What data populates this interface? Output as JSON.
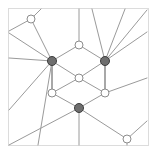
{
  "figure": {
    "title": "",
    "width": 160,
    "height": 159,
    "background_color": "#ffffff",
    "frame": {
      "visible": true,
      "style": "dotted",
      "color": "#b9b9b9",
      "x": 8.5,
      "y": 8.5,
      "width": 140,
      "height": 137
    }
  },
  "legend": {
    "filled_node_label": "filled-node",
    "open_node_label": "open-node",
    "filled_color": "#6e6e6e",
    "open_color": "#ffffff",
    "edge_color": "#9a9a9a"
  },
  "chart_data": {
    "type": "scatter",
    "title": "",
    "xlabel": "",
    "ylabel": "",
    "xlim": [
      0,
      160
    ],
    "ylim": [
      0,
      159
    ],
    "grid": false,
    "legend_position": "none",
    "nodes": [
      {
        "id": "n1",
        "label": "left-filled",
        "x": 52,
        "y": 61,
        "style": "filled",
        "radius": 4.5
      },
      {
        "id": "n2",
        "label": "right-filled",
        "x": 105,
        "y": 61,
        "style": "filled",
        "radius": 4.5
      },
      {
        "id": "n3",
        "label": "bottom-filled",
        "x": 79,
        "y": 108,
        "style": "filled",
        "radius": 4.5
      },
      {
        "id": "n4",
        "label": "top-open",
        "x": 79,
        "y": 45,
        "style": "open",
        "radius": 4.0
      },
      {
        "id": "n5",
        "label": "center-open",
        "x": 79,
        "y": 78,
        "style": "open",
        "radius": 4.0
      },
      {
        "id": "n6",
        "label": "left-lower-open",
        "x": 52,
        "y": 93,
        "style": "open",
        "radius": 4.0
      },
      {
        "id": "n7",
        "label": "right-lower-open",
        "x": 105,
        "y": 93,
        "style": "open",
        "radius": 4.0
      },
      {
        "id": "n8",
        "label": "upper-left-open",
        "x": 31,
        "y": 19,
        "style": "open",
        "radius": 4.0
      },
      {
        "id": "n9",
        "label": "lower-right-open",
        "x": 127,
        "y": 139,
        "style": "open",
        "radius": 4.0
      }
    ],
    "edges": [
      {
        "from": "n1",
        "to": "n4",
        "weight": 1
      },
      {
        "from": "n2",
        "to": "n4",
        "weight": 1
      },
      {
        "from": "n1",
        "to": "n5",
        "weight": 1
      },
      {
        "from": "n2",
        "to": "n5",
        "weight": 1
      },
      {
        "from": "n5",
        "to": "n6",
        "weight": 1
      },
      {
        "from": "n5",
        "to": "n7",
        "weight": 1
      },
      {
        "from": "n6",
        "to": "n3",
        "weight": 1
      },
      {
        "from": "n7",
        "to": "n3",
        "weight": 1
      },
      {
        "from": "n1",
        "to": "n6",
        "weight": 2
      },
      {
        "from": "n2",
        "to": "n7",
        "weight": 2
      },
      {
        "from": "n1",
        "to": "n8",
        "weight": 1
      },
      {
        "from": "n3",
        "to": "n9",
        "weight": 1
      }
    ],
    "radiating_segments": [
      {
        "label": "top-left-to-frame-up",
        "x1": 31,
        "y1": 19,
        "x2": 41,
        "y2": 9
      },
      {
        "label": "top-left-to-frame-left",
        "x1": 31,
        "y1": 19,
        "x2": 9,
        "y2": 31
      },
      {
        "label": "left-filled-to-upper-left",
        "x1": 52,
        "y1": 61,
        "x2": 9,
        "y2": 33
      },
      {
        "label": "left-filled-to-left-edge",
        "x1": 52,
        "y1": 61,
        "x2": 9,
        "y2": 58
      },
      {
        "label": "left-filled-to-lower-left",
        "x1": 52,
        "y1": 61,
        "x2": 9,
        "y2": 110
      },
      {
        "label": "left-filled-to-bottom",
        "x1": 52,
        "y1": 61,
        "x2": 38,
        "y2": 145
      },
      {
        "label": "top-open-to-top-edge",
        "x1": 79,
        "y1": 45,
        "x2": 79,
        "y2": 9
      },
      {
        "label": "right-filled-to-top-a",
        "x1": 105,
        "y1": 61,
        "x2": 92,
        "y2": 9
      },
      {
        "label": "right-filled-to-top-b",
        "x1": 105,
        "y1": 61,
        "x2": 125,
        "y2": 9
      },
      {
        "label": "right-filled-to-corner",
        "x1": 105,
        "y1": 61,
        "x2": 147,
        "y2": 10
      },
      {
        "label": "right-filled-to-right-a",
        "x1": 105,
        "y1": 61,
        "x2": 147,
        "y2": 32
      },
      {
        "label": "right-lower-to-right",
        "x1": 105,
        "y1": 93,
        "x2": 147,
        "y2": 78
      },
      {
        "label": "bottom-filled-to-left",
        "x1": 79,
        "y1": 108,
        "x2": 9,
        "y2": 145
      },
      {
        "label": "bottom-filled-to-bottom",
        "x1": 79,
        "y1": 108,
        "x2": 79,
        "y2": 145
      },
      {
        "label": "lower-right-to-right",
        "x1": 127,
        "y1": 139,
        "x2": 147,
        "y2": 121
      },
      {
        "label": "lower-right-to-bottom",
        "x1": 127,
        "y1": 139,
        "x2": 127,
        "y2": 145
      }
    ]
  }
}
